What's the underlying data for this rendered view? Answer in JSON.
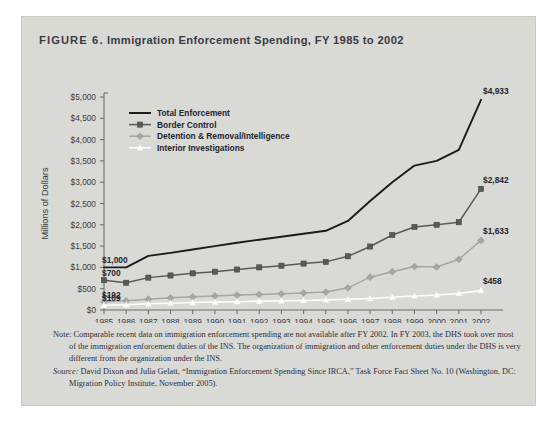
{
  "figure": {
    "number": "FIGURE 6.",
    "title": "Immigration Enforcement Spending, FY 1985 to 2002"
  },
  "notes": {
    "note_label": "Note:",
    "note_text": " Comparable recent data on immigration enforcement spending are not available after FY 2002. In FY 2003, the DHS took over most of the immigration enforcement duties of the INS. The organization of immigration and other enforcement duties under the DHS is very different from the organization under the INS.",
    "source_label": "Source:",
    "source_text": " David Dixon and Julia Gelatt, “Immigration Enforcement Spending Since IRCA,” Task Force Fact Sheet No. 10 (Washington, DC: Migration Policy Institute, November 2005)."
  },
  "chart_data": {
    "type": "line",
    "title": "Immigration Enforcement Spending, FY 1985 to 2002",
    "xlabel": "",
    "ylabel": "Millions of Dollars",
    "ylim": [
      0,
      5000
    ],
    "ytick_step": 500,
    "ytick_labels": [
      "$0",
      "$500",
      "$1,000",
      "$1,500",
      "$2,000",
      "$2,500",
      "$3,000",
      "$3,500",
      "$4,000",
      "$4,500",
      "$5,000"
    ],
    "grid": false,
    "legend_position": "upper-left-inside",
    "categories": [
      1985,
      1986,
      1987,
      1988,
      1989,
      1990,
      1991,
      1992,
      1993,
      1994,
      1995,
      1996,
      1997,
      1998,
      1999,
      2000,
      2001,
      2002
    ],
    "xtick_labels": [
      "1985",
      "1986",
      "1987",
      "1988",
      "1989",
      "1990",
      "1991",
      "1992",
      "1993",
      "1994",
      "1995",
      "1996",
      "1997",
      "1998",
      "1999",
      "2000",
      "2001",
      "2002"
    ],
    "series": [
      {
        "name": "Total Enforcement",
        "color": "#1b1b1b",
        "marker": "none",
        "values": [
          1000,
          1000,
          1270,
          1340,
          1420,
          1500,
          1580,
          1650,
          1720,
          1790,
          1860,
          2090,
          2560,
          3000,
          3390,
          3500,
          3760,
          4933
        ],
        "start_label": "$1,000",
        "end_label": "$4,933"
      },
      {
        "name": "Border Control",
        "color": "#5a5a5a",
        "marker": "square",
        "values": [
          700,
          640,
          760,
          810,
          860,
          900,
          950,
          1000,
          1040,
          1090,
          1130,
          1260,
          1490,
          1760,
          1950,
          2000,
          2060,
          2842
        ],
        "start_label": "$700",
        "end_label": "$2,842"
      },
      {
        "name": "Detention & Removal/Intelligence",
        "color": "#a6a6a6",
        "marker": "diamond",
        "values": [
          192,
          215,
          255,
          285,
          310,
          330,
          350,
          365,
          380,
          400,
          420,
          520,
          770,
          900,
          1020,
          1010,
          1190,
          1633
        ],
        "start_label": "$192",
        "end_label": "$1,633"
      },
      {
        "name": "Interior Investigations",
        "color": "#ffffff",
        "marker": "triangle",
        "values": [
          109,
          125,
          145,
          160,
          175,
          185,
          195,
          205,
          215,
          225,
          235,
          250,
          270,
          300,
          330,
          350,
          390,
          458
        ],
        "start_label": "$109",
        "end_label": "$458"
      }
    ]
  }
}
